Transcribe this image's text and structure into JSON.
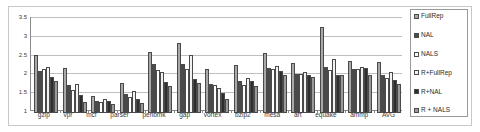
{
  "chart_data": {
    "type": "bar",
    "title": "",
    "subtitle": "",
    "xlabel": "",
    "ylabel": "",
    "ylim": [
      1,
      3.5
    ],
    "yticks": [
      "1",
      "1.5",
      "2",
      "2.5",
      "3",
      "3.5"
    ],
    "ytick_values": [
      1,
      1.5,
      2,
      2.5,
      3,
      3.5
    ],
    "grid": true,
    "legend_position": "right",
    "categories": [
      "gzip",
      "vpr",
      "mcf",
      "parser",
      "perlbmk",
      "gap",
      "vortex",
      "bzip2",
      "mesa",
      "art",
      "equake",
      "ammp",
      "AVG"
    ],
    "series": [
      {
        "name": "FullRep",
        "color": "#a8a8a8",
        "values": [
          2.54,
          2.2,
          1.46,
          1.79,
          2.62,
          2.85,
          2.16,
          2.28,
          2.6,
          2.33,
          3.3,
          2.38,
          2.36
        ]
      },
      {
        "name": "NAL",
        "color": "#4a4a4a",
        "values": [
          2.13,
          1.75,
          1.33,
          1.5,
          2.31,
          2.3,
          1.78,
          1.84,
          2.2,
          2.05,
          2.22,
          2.17,
          2.0
        ]
      },
      {
        "name": "NALS",
        "color": "#ffffff",
        "values": [
          2.17,
          1.62,
          1.3,
          1.42,
          2.15,
          2.16,
          1.74,
          1.74,
          2.17,
          2.04,
          2.15,
          2.16,
          1.93
        ]
      },
      {
        "name": "R+FullRep",
        "color": "#f2f2f2",
        "values": [
          2.23,
          1.76,
          1.38,
          1.58,
          2.1,
          2.55,
          1.66,
          1.93,
          2.24,
          2.1,
          2.44,
          2.23,
          2.1
        ]
      },
      {
        "name": "R+NAL",
        "color": "#2e2e2e",
        "values": [
          1.95,
          1.49,
          1.33,
          1.36,
          1.82,
          1.91,
          1.52,
          1.84,
          2.12,
          2.01,
          2.01,
          2.21,
          1.87
        ]
      },
      {
        "name": "R + NALS",
        "color": "#9a9a9a",
        "values": [
          1.85,
          1.3,
          1.24,
          1.27,
          1.73,
          1.8,
          1.38,
          1.73,
          2.0,
          1.97,
          2.0,
          2.0,
          1.78
        ]
      }
    ]
  }
}
